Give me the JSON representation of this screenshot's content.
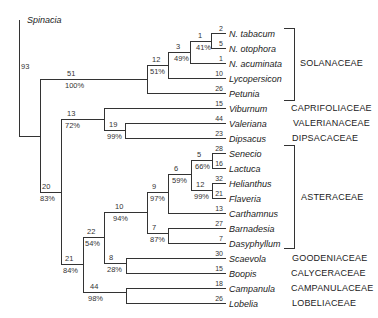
{
  "outgroup": {
    "name": "Spinacia",
    "x": 27,
    "y": 20
  },
  "root_label": {
    "text": "93",
    "x": 21,
    "y": 63
  },
  "leaves": [
    {
      "name": "N. tabacum",
      "len": "2",
      "y": 33
    },
    {
      "name": "N. otophora",
      "len": "5",
      "y": 48
    },
    {
      "name": "N. acuminata",
      "len": "1",
      "y": 63
    },
    {
      "name": "Lycopersicon",
      "len": "10",
      "y": 78
    },
    {
      "name": "Petunia",
      "len": "26",
      "y": 93
    },
    {
      "name": "Viburnum",
      "len": "15",
      "y": 108
    },
    {
      "name": "Valeriana",
      "len": "44",
      "y": 123
    },
    {
      "name": "Dipsacus",
      "len": "23",
      "y": 138
    },
    {
      "name": "Senecio",
      "len": "28",
      "y": 153
    },
    {
      "name": "Lactuca",
      "len": "16",
      "y": 168
    },
    {
      "name": "Helianthus",
      "len": "32",
      "y": 183
    },
    {
      "name": "Flaveria",
      "len": "21",
      "y": 198
    },
    {
      "name": "Carthamnus",
      "len": "13",
      "y": 213
    },
    {
      "name": "Barnadesia",
      "len": "27",
      "y": 228
    },
    {
      "name": "Dasyphyllum",
      "len": "7",
      "y": 243
    },
    {
      "name": "Scaevola",
      "len": "30",
      "y": 258
    },
    {
      "name": "Boopis",
      "len": "15",
      "y": 273
    },
    {
      "name": "Campanula",
      "len": "18",
      "y": 288
    },
    {
      "name": "Lobelia",
      "len": "26",
      "y": 303
    }
  ],
  "node_labels": [
    {
      "num": "1",
      "pct": "41%",
      "x": 198,
      "y": 41
    },
    {
      "num": "3",
      "pct": "49%",
      "x": 176,
      "y": 52
    },
    {
      "num": "12",
      "pct": "51%",
      "x": 152,
      "y": 65
    },
    {
      "num": "51",
      "pct": "100%",
      "x": 67,
      "y": 79
    },
    {
      "num": "13",
      "pct": "72%",
      "x": 67,
      "y": 119
    },
    {
      "num": "19",
      "pct": "99%",
      "x": 109,
      "y": 130
    },
    {
      "num": "20",
      "pct": "83%",
      "x": 42,
      "y": 192
    },
    {
      "num": "5",
      "pct": "66%",
      "x": 197,
      "y": 160
    },
    {
      "num": "6",
      "pct": "59%",
      "x": 174,
      "y": 174
    },
    {
      "num": "12",
      "pct": "99%",
      "x": 196,
      "y": 190
    },
    {
      "num": "9",
      "pct": "97%",
      "x": 152,
      "y": 192
    },
    {
      "num": "10",
      "pct": "94%",
      "x": 115,
      "y": 212
    },
    {
      "num": "7",
      "pct": "87%",
      "x": 152,
      "y": 233
    },
    {
      "num": "22",
      "pct": "54%",
      "x": 87,
      "y": 237
    },
    {
      "num": "8",
      "pct": "28%",
      "x": 109,
      "y": 263
    },
    {
      "num": "21",
      "pct": "84%",
      "x": 65,
      "y": 264
    },
    {
      "num": "44",
      "pct": "98%",
      "x": 90,
      "y": 292
    }
  ],
  "families": [
    {
      "name": "SOLANACEAE",
      "x": 300,
      "y": 63
    },
    {
      "name": "CAPRIFOLIACEAE",
      "x": 291,
      "y": 108
    },
    {
      "name": "VALERIANACEAE",
      "x": 293,
      "y": 123
    },
    {
      "name": "DIPSACACEAE",
      "x": 292,
      "y": 138
    },
    {
      "name": "ASTERACEAE",
      "x": 301,
      "y": 197
    },
    {
      "name": "GOODENIACEAE",
      "x": 292,
      "y": 258
    },
    {
      "name": "CALYCERACEAE",
      "x": 291,
      "y": 273
    },
    {
      "name": "CAMPANULACEAE",
      "x": 291,
      "y": 288
    },
    {
      "name": "LOBELIACEAE",
      "x": 292,
      "y": 303
    }
  ],
  "brackets": [
    {
      "family": "SOLANACEAE",
      "x": 294,
      "y1": 28,
      "y2": 100,
      "tick_left": 284
    },
    {
      "family": "ASTERACEAE",
      "x": 294,
      "y1": 145,
      "y2": 248,
      "tick_left": 284
    }
  ],
  "segments": {
    "h": [
      [
        19,
        40,
        136
      ],
      [
        40,
        147,
        79
      ],
      [
        147,
        168,
        65
      ],
      [
        168,
        190,
        52
      ],
      [
        190,
        211,
        41
      ],
      [
        211,
        225,
        33
      ],
      [
        211,
        225,
        48
      ],
      [
        190,
        225,
        63
      ],
      [
        168,
        225,
        78
      ],
      [
        147,
        225,
        93
      ],
      [
        40,
        61,
        192
      ],
      [
        61,
        104,
        119
      ],
      [
        104,
        225,
        108
      ],
      [
        104,
        125,
        130
      ],
      [
        125,
        225,
        123
      ],
      [
        125,
        225,
        138
      ],
      [
        61,
        83,
        264
      ],
      [
        83,
        104,
        237
      ],
      [
        104,
        147,
        212
      ],
      [
        147,
        168,
        192
      ],
      [
        168,
        191,
        174
      ],
      [
        191,
        212,
        160
      ],
      [
        212,
        225,
        153
      ],
      [
        212,
        225,
        168
      ],
      [
        191,
        212,
        190
      ],
      [
        212,
        225,
        183
      ],
      [
        212,
        225,
        198
      ],
      [
        168,
        225,
        213
      ],
      [
        147,
        168,
        233
      ],
      [
        168,
        225,
        228
      ],
      [
        168,
        225,
        243
      ],
      [
        104,
        126,
        263
      ],
      [
        126,
        225,
        258
      ],
      [
        126,
        225,
        273
      ],
      [
        83,
        126,
        292
      ],
      [
        126,
        225,
        288
      ],
      [
        126,
        225,
        303
      ]
    ],
    "v": [
      [
        19,
        20,
        136
      ],
      [
        40,
        79,
        192
      ],
      [
        147,
        65,
        93
      ],
      [
        168,
        52,
        78
      ],
      [
        190,
        41,
        63
      ],
      [
        211,
        33,
        48
      ],
      [
        61,
        119,
        264
      ],
      [
        104,
        108,
        130
      ],
      [
        125,
        123,
        138
      ],
      [
        83,
        237,
        292
      ],
      [
        104,
        212,
        263
      ],
      [
        147,
        192,
        233
      ],
      [
        168,
        174,
        213
      ],
      [
        191,
        160,
        190
      ],
      [
        212,
        153,
        168
      ],
      [
        212,
        183,
        198
      ],
      [
        168,
        228,
        243
      ],
      [
        126,
        258,
        273
      ],
      [
        126,
        288,
        303
      ]
    ]
  }
}
